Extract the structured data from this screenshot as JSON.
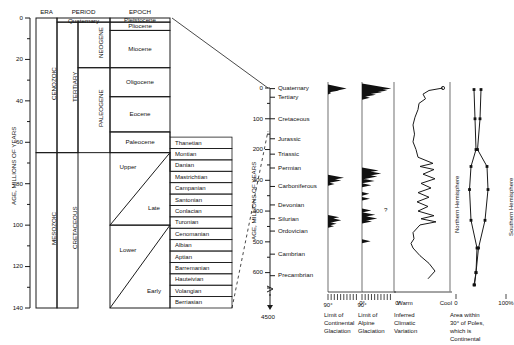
{
  "left_chart": {
    "axis_label": "AGE, MILLIONS OF YEARS",
    "ticks": [
      "0",
      "20",
      "40",
      "60",
      "80",
      "100",
      "120",
      "140"
    ],
    "headers": {
      "era": "ERA",
      "period": "PERIOD",
      "epoch": "EPOCH"
    },
    "eras": [
      {
        "label": "CENOZOIC",
        "top_ma": 0,
        "bottom_ma": 65
      },
      {
        "label": "MESOZOIC",
        "top_ma": 65,
        "bottom_ma": 140
      }
    ],
    "periods": [
      {
        "label": "Quaternary",
        "top_ma": 0,
        "bottom_ma": 2
      },
      {
        "label": "TERTIARY",
        "top_ma": 2,
        "bottom_ma": 65
      },
      {
        "label": "CRETACEOUS",
        "top_ma": 65,
        "bottom_ma": 140
      }
    ],
    "subperiods": [
      {
        "label": "NEOGENE",
        "top_ma": 2,
        "bottom_ma": 24
      },
      {
        "label": "PALEOGENE",
        "top_ma": 24,
        "bottom_ma": 65
      }
    ],
    "epochs": [
      {
        "label": "Pleistocene",
        "top_ma": 0,
        "bottom_ma": 2
      },
      {
        "label": "Pliocene",
        "top_ma": 2,
        "bottom_ma": 6
      },
      {
        "label": "Miocene",
        "top_ma": 6,
        "bottom_ma": 24
      },
      {
        "label": "Oligocene",
        "top_ma": 24,
        "bottom_ma": 38
      },
      {
        "label": "Eocene",
        "top_ma": 38,
        "bottom_ma": 55
      },
      {
        "label": "Paleocene",
        "top_ma": 55,
        "bottom_ma": 65
      },
      {
        "label": "Upper",
        "top_ma": 65,
        "bottom_ma": 100
      },
      {
        "label": "Late",
        "top_ma": 65,
        "bottom_ma": 100
      },
      {
        "label": "Lower",
        "top_ma": 100,
        "bottom_ma": 140
      },
      {
        "label": "Early",
        "top_ma": 100,
        "bottom_ma": 140
      }
    ],
    "stages": [
      "Thanetian",
      "Montian",
      "Danian",
      "Mastrichtian",
      "Campanian",
      "Santonian",
      "Conlacian",
      "Turonian",
      "Cenomanian",
      "Albian",
      "Aptian",
      "Barremanian",
      "Hauteivian",
      "Volangian",
      "Berriasian"
    ]
  },
  "right_chart": {
    "axis_label": "AGE, MILLIONS OF YEARS",
    "ticks": [
      "0",
      "100",
      "200",
      "300",
      "400",
      "500",
      "600"
    ],
    "base_tick": "4500",
    "periods": [
      {
        "label": "Quaternary",
        "ma": 2
      },
      {
        "label": "Tertiary",
        "ma": 30
      },
      {
        "label": "Cretaceous",
        "ma": 100
      },
      {
        "label": "Jurassic",
        "ma": 165
      },
      {
        "label": "Triassic",
        "ma": 215
      },
      {
        "label": "Permian",
        "ma": 260
      },
      {
        "label": "Carboniferous",
        "ma": 320
      },
      {
        "label": "Devonian",
        "ma": 380
      },
      {
        "label": "Silurian",
        "ma": 425
      },
      {
        "label": "Ordovician",
        "ma": 465
      },
      {
        "label": "Cambrian",
        "ma": 540
      },
      {
        "label": "Precambrian",
        "ma": 610
      }
    ]
  },
  "panels": {
    "continental": {
      "caption": [
        "Limit of",
        "Continental",
        "Glaciation"
      ],
      "axis_left": "90°",
      "axis_right": "0°"
    },
    "alpine": {
      "caption": [
        "Limit of",
        "Alpine",
        "Glaciation"
      ],
      "axis_left": "90°",
      "axis_right": "0°",
      "uncertain_marker": "?"
    },
    "climate": {
      "caption": [
        "Inferred",
        "Climatic",
        "Variation"
      ],
      "axis_left": "Warm",
      "axis_right": "Cool"
    },
    "polar": {
      "caption": [
        "Area within",
        "30° of Poles,",
        "which is",
        "Continental"
      ],
      "axis_left": "0",
      "axis_right": "100%",
      "series": [
        {
          "name": "Northern Hemisphere"
        },
        {
          "name": "Southern Hemisphere"
        }
      ]
    }
  },
  "chart_data": {
    "type": "line",
    "ylabel": "AGE, MILLIONS OF YEARS",
    "ylim": [
      0,
      650
    ],
    "grid": false,
    "series": [
      {
        "name": "Limit of Continental Glaciation",
        "xlabel_left": "90°",
        "xlabel_right": "0°",
        "peaks_ma_latitude": [
          [
            2,
            55
          ],
          [
            10,
            8
          ],
          [
            290,
            48
          ],
          [
            300,
            42
          ],
          [
            310,
            25
          ],
          [
            420,
            35
          ],
          [
            435,
            40
          ],
          [
            445,
            30
          ]
        ]
      },
      {
        "name": "Limit of Alpine Glaciation",
        "xlabel_left": "90°",
        "xlabel_right": "0°",
        "peaks_ma_latitude": [
          [
            2,
            80
          ],
          [
            12,
            62
          ],
          [
            20,
            40
          ],
          [
            30,
            22
          ],
          [
            270,
            52
          ],
          [
            285,
            55
          ],
          [
            300,
            40
          ],
          [
            320,
            30
          ],
          [
            360,
            25
          ],
          [
            400,
            30
          ],
          [
            420,
            42
          ],
          [
            430,
            35
          ],
          [
            500,
            25
          ]
        ]
      },
      {
        "name": "Inferred Climatic Variation",
        "xlabel_left": "Warm",
        "xlabel_right": "Cool",
        "points_ma_coolness": [
          [
            0,
            0.9
          ],
          [
            8,
            0.62
          ],
          [
            20,
            0.5
          ],
          [
            35,
            0.55
          ],
          [
            50,
            0.42
          ],
          [
            70,
            0.4
          ],
          [
            95,
            0.34
          ],
          [
            120,
            0.3
          ],
          [
            150,
            0.33
          ],
          [
            175,
            0.3
          ],
          [
            200,
            0.36
          ],
          [
            225,
            0.4
          ],
          [
            245,
            0.7
          ],
          [
            255,
            0.44
          ],
          [
            265,
            0.72
          ],
          [
            280,
            0.5
          ],
          [
            295,
            0.74
          ],
          [
            310,
            0.46
          ],
          [
            325,
            0.66
          ],
          [
            340,
            0.4
          ],
          [
            355,
            0.62
          ],
          [
            370,
            0.38
          ],
          [
            385,
            0.6
          ],
          [
            400,
            0.4
          ],
          [
            415,
            0.72
          ],
          [
            425,
            0.46
          ],
          [
            435,
            0.76
          ],
          [
            445,
            0.44
          ],
          [
            470,
            0.3
          ],
          [
            490,
            0.32
          ],
          [
            505,
            0.26
          ],
          [
            520,
            0.3
          ],
          [
            545,
            0.44
          ],
          [
            570,
            0.62
          ],
          [
            595,
            0.74
          ],
          [
            620,
            0.6
          ]
        ]
      },
      {
        "name": "Northern Hemisphere",
        "xlabel_left": "0",
        "xlabel_right": "100%",
        "points_ma_percent": [
          [
            5,
            36
          ],
          [
            100,
            38
          ],
          [
            200,
            40
          ],
          [
            255,
            30
          ],
          [
            330,
            27
          ],
          [
            430,
            30
          ],
          [
            520,
            42
          ],
          [
            600,
            40
          ],
          [
            640,
            37
          ]
        ]
      },
      {
        "name": "Southern Hemisphere",
        "xlabel_left": "0",
        "xlabel_right": "100%",
        "points_ma_percent": [
          [
            5,
            50
          ],
          [
            100,
            48
          ],
          [
            200,
            43
          ],
          [
            255,
            62
          ],
          [
            330,
            64
          ],
          [
            430,
            58
          ],
          [
            520,
            45
          ],
          [
            600,
            40
          ],
          [
            640,
            36
          ]
        ]
      }
    ]
  }
}
